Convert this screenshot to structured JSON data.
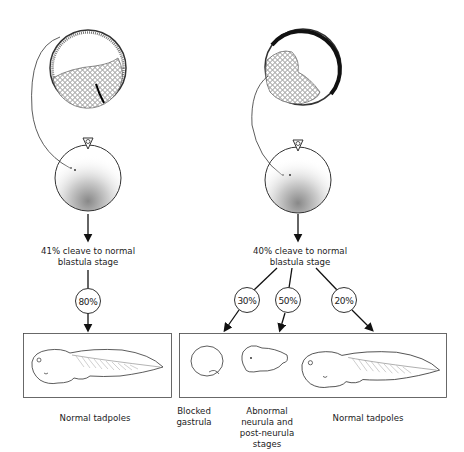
{
  "diagram": {
    "left_branch": {
      "cleave_text_line1": "41% cleave to normal",
      "cleave_text_line2": "blastula stage",
      "branches": [
        {
          "percent": "80%",
          "outcome": "Normal tadpoles"
        }
      ],
      "outcome_label": "Normal tadpoles"
    },
    "right_branch": {
      "cleave_text_line1": "40% cleave to normal",
      "cleave_text_line2": "blastula stage",
      "branches": [
        {
          "percent": "30%",
          "outcome": "Blocked gastrula"
        },
        {
          "percent": "50%",
          "outcome": "Abnormal neurula and post-neurula stages"
        },
        {
          "percent": "20%",
          "outcome": "Normal tadpoles"
        }
      ],
      "outcome_labels": {
        "blocked_line1": "Blocked",
        "blocked_line2": "gastrula",
        "abnormal_line1": "Abnormal",
        "abnormal_line2": "neurula and",
        "abnormal_line3": "post-neurula",
        "abnormal_line4": "stages",
        "normal": "Normal tadpoles"
      }
    },
    "colors": {
      "ink": "#1a1a1a",
      "background": "#ffffff"
    }
  }
}
